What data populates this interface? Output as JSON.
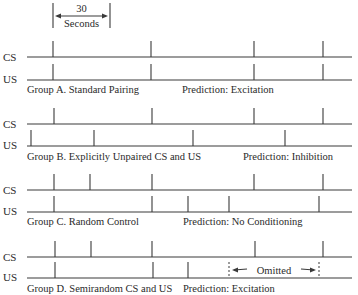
{
  "header": {
    "interval_value": "30",
    "interval_unit": "Seconds",
    "bracket_x": [
      53,
      110
    ]
  },
  "line_labels": {
    "cs": "CS",
    "us": "US"
  },
  "groups": [
    {
      "id": "A",
      "title": "Group A. Standard Pairing",
      "prediction": "Prediction: Excitation",
      "cs_y": 57,
      "us_y": 80,
      "label_y": 90,
      "cs_events": [
        53,
        151,
        254,
        323
      ],
      "us_events": [
        53,
        151,
        254,
        323
      ]
    },
    {
      "id": "B",
      "title": "Group B. Explicitly Unpaired CS and US",
      "prediction": "Prediction: Inhibition",
      "cs_y": 124,
      "us_y": 146,
      "label_y": 157,
      "cs_events": [
        54,
        152,
        254,
        323
      ],
      "us_events": [
        31,
        94,
        193,
        285
      ]
    },
    {
      "id": "C",
      "title": "Group C. Random Control",
      "prediction": "Prediction: No Conditioning",
      "cs_y": 190,
      "us_y": 212,
      "label_y": 222,
      "cs_events": [
        54,
        90,
        152,
        254,
        323
      ],
      "us_events": [
        54,
        152,
        188,
        229,
        319
      ]
    },
    {
      "id": "D",
      "title": "Group D. Semirandom CS and US",
      "prediction": "Prediction: Excitation",
      "cs_y": 257,
      "us_y": 278,
      "label_y": 289,
      "cs_events": [
        55,
        91,
        152,
        255,
        323
      ],
      "us_events": [
        55,
        153,
        188
      ],
      "omitted": {
        "label": "Omitted",
        "x_start": 229,
        "x_end": 319
      }
    }
  ]
}
